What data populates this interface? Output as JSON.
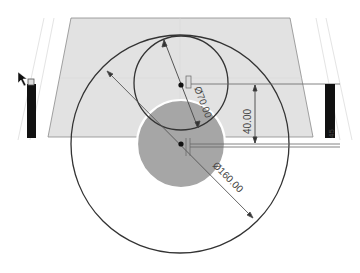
{
  "drawing": {
    "type": "2D sketch view",
    "colors": {
      "background": "#ffffff",
      "plane_fill": "#e2e2e2",
      "plane_edge": "#8a8a8a",
      "profile_fill": "#a6a6a6",
      "profile_outline": "#ffffff",
      "sketch_line": "#333333",
      "dimension_line": "#555555",
      "side_bar": "#111111",
      "guide_line": "#e6e6e6"
    },
    "dimensions": {
      "small_circle_diameter": "Ø70.00",
      "vertical_offset": "40.00",
      "large_circle_diameter": "Ø160.00",
      "side_label": "45"
    },
    "icons": {
      "cursor": "arrow-cursor-icon",
      "left_bar_handle": "constraint-glyph-icon"
    }
  }
}
